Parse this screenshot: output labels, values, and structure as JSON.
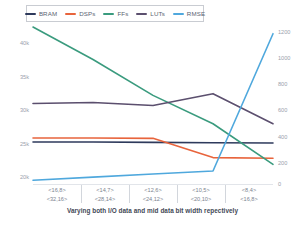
{
  "chart_data": {
    "type": "line",
    "title": "",
    "caption": "Varying both I/O data and mid data bit width repectively",
    "xlabel": "Varying both I/O data and mid data bit width repectively",
    "ylabel": "",
    "grid": false,
    "legend_position": "top-left",
    "categories": [
      "<16,8>\n<32,16>",
      "<14,7>\n<28,14>",
      "<12,6>\n<24,12>",
      "<10,5>\n<20,10>",
      "<8,4>\n<16,8>"
    ],
    "category_lines": [
      {
        "top": "<16,8>",
        "bottom": "<32,16>"
      },
      {
        "top": "<14,7>",
        "bottom": "<28,14>"
      },
      {
        "top": "<12,6>",
        "bottom": "<24,12>"
      },
      {
        "top": "<10,5>",
        "bottom": "<20,10>"
      },
      {
        "top": "<8,4>",
        "bottom": "<16,8>"
      }
    ],
    "left_axis": {
      "label": "",
      "ticks": [
        "40k",
        "35k",
        "30k",
        "25k",
        "20k"
      ],
      "values": [
        40000,
        35000,
        30000,
        25000,
        20000
      ],
      "ylim": [
        18000,
        41500
      ]
    },
    "right_axis": {
      "label": "",
      "ticks": [
        "1200",
        "1000",
        "800",
        "600",
        "400",
        "200",
        "0"
      ],
      "values": [
        1200,
        1000,
        800,
        600,
        400,
        200,
        0
      ],
      "ylim": [
        0,
        1280
      ]
    },
    "series": [
      {
        "name": "BRAM",
        "color": "#2e3a5c",
        "axis": "left",
        "values": [
          24200,
          24200,
          24150,
          24100,
          24050
        ]
      },
      {
        "name": "DSPs",
        "color": "#e8643c",
        "axis": "left",
        "values": [
          24800,
          24800,
          24750,
          21900,
          21800
        ]
      },
      {
        "name": "FFs",
        "color": "#3a9b7e",
        "axis": "left",
        "values": [
          41200,
          36400,
          31100,
          26900,
          20900
        ]
      },
      {
        "name": "LUTs",
        "color": "#5b4f6e",
        "axis": "left",
        "values": [
          29900,
          30050,
          29600,
          31350,
          26900
        ]
      },
      {
        "name": "RMSE",
        "color": "#4fa8dd",
        "axis": "right",
        "values": [
          30,
          55,
          80,
          105,
          1210
        ]
      }
    ]
  },
  "legend": {
    "items": [
      {
        "label": "BRAM",
        "color": "#2e3a5c"
      },
      {
        "label": "DSPs",
        "color": "#e8643c"
      },
      {
        "label": "FFs",
        "color": "#3a9b7e"
      },
      {
        "label": "LUTs",
        "color": "#5b4f6e"
      },
      {
        "label": "RMSE",
        "color": "#4fa8dd"
      }
    ]
  }
}
